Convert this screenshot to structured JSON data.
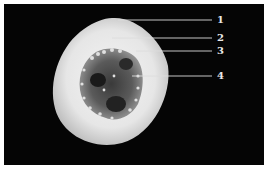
{
  "figure": {
    "background_color": "#050505",
    "callouts": [
      {
        "number": "1"
      },
      {
        "number": "2"
      },
      {
        "number": "3"
      },
      {
        "number": "4"
      }
    ]
  }
}
